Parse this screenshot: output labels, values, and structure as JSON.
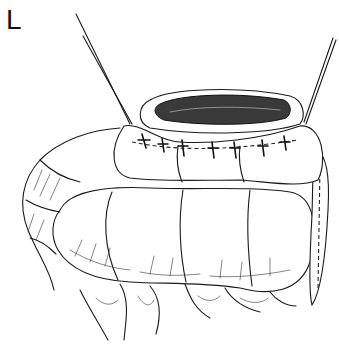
{
  "figure": {
    "panel_label": "L",
    "colors": {
      "background": "#ffffff",
      "line": "#1a1a1a",
      "lumen_shading": "#3a3a3a"
    }
  }
}
